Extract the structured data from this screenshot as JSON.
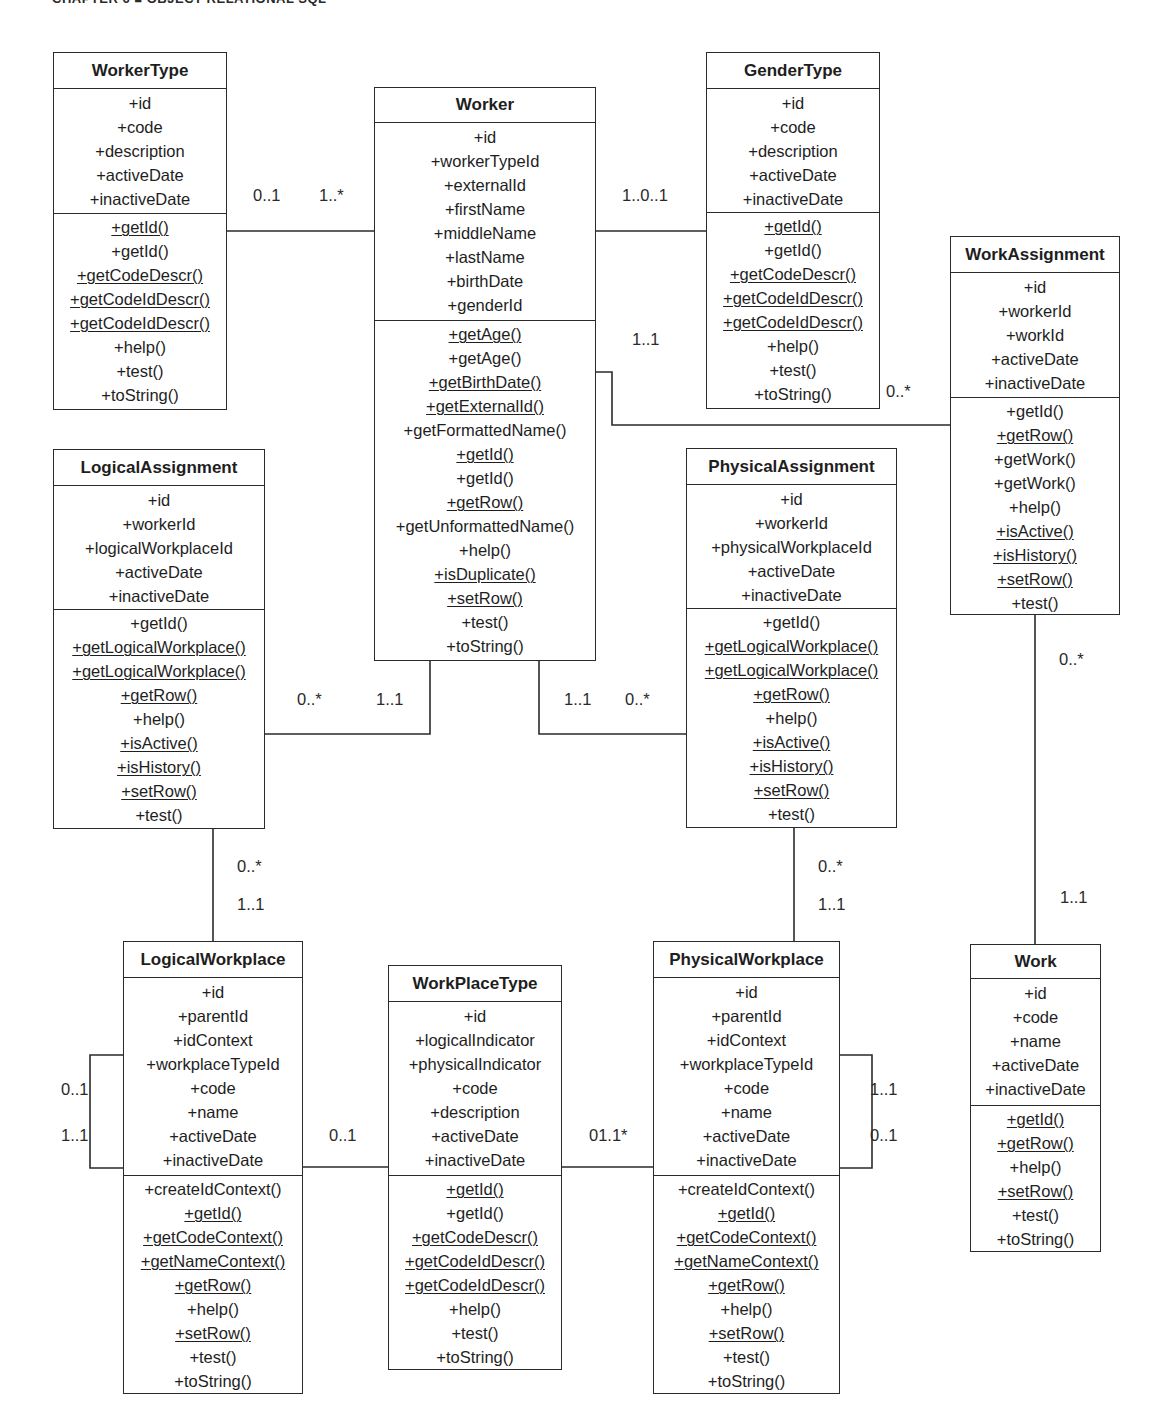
{
  "page": {
    "header": "CHAPTER 6 ■ OBJECT-RELATIONAL SQL"
  },
  "classes": {
    "workerType": {
      "name": "WorkerType",
      "attributes": [
        "+id",
        "+code",
        "+description",
        "+activeDate",
        "+inactiveDate"
      ],
      "methods": [
        {
          "label": "+getId()",
          "static": true
        },
        {
          "label": "+getId()",
          "static": false
        },
        {
          "label": "+getCodeDescr()",
          "static": true
        },
        {
          "label": "+getCodeIdDescr()",
          "static": true
        },
        {
          "label": "+getCodeIdDescr()",
          "static": true
        },
        {
          "label": "+help()",
          "static": false
        },
        {
          "label": "+test()",
          "static": false
        },
        {
          "label": "+toString()",
          "static": false
        }
      ]
    },
    "worker": {
      "name": "Worker",
      "attributes": [
        "+id",
        "+workerTypeId",
        "+externalId",
        "+firstName",
        "+middleName",
        "+lastName",
        "+birthDate",
        "+genderId"
      ],
      "methods": [
        {
          "label": "+getAge()",
          "static": true
        },
        {
          "label": "+getAge()",
          "static": false
        },
        {
          "label": "+getBirthDate()",
          "static": true
        },
        {
          "label": "+getExternalId()",
          "static": true
        },
        {
          "label": "+getFormattedName()",
          "static": false
        },
        {
          "label": "+getId()",
          "static": true
        },
        {
          "label": "+getId()",
          "static": false
        },
        {
          "label": "+getRow()",
          "static": true
        },
        {
          "label": "+getUnformattedName()",
          "static": false
        },
        {
          "label": "+help()",
          "static": false
        },
        {
          "label": "+isDuplicate()",
          "static": true
        },
        {
          "label": "+setRow()",
          "static": true
        },
        {
          "label": "+test()",
          "static": false
        },
        {
          "label": "+toString()",
          "static": false
        }
      ]
    },
    "genderType": {
      "name": "GenderType",
      "attributes": [
        "+id",
        "+code",
        "+description",
        "+activeDate",
        "+inactiveDate"
      ],
      "methods": [
        {
          "label": "+getId()",
          "static": true
        },
        {
          "label": "+getId()",
          "static": false
        },
        {
          "label": "+getCodeDescr()",
          "static": true
        },
        {
          "label": "+getCodeIdDescr()",
          "static": true
        },
        {
          "label": "+getCodeIdDescr()",
          "static": true
        },
        {
          "label": "+help()",
          "static": false
        },
        {
          "label": "+test()",
          "static": false
        },
        {
          "label": "+toString()",
          "static": false
        }
      ]
    },
    "workAssignment": {
      "name": "WorkAssignment",
      "attributes": [
        "+id",
        "+workerId",
        "+workId",
        "+activeDate",
        "+inactiveDate"
      ],
      "methods": [
        {
          "label": "+getId()",
          "static": false
        },
        {
          "label": "+getRow()",
          "static": true
        },
        {
          "label": "+getWork()",
          "static": false
        },
        {
          "label": "+getWork()",
          "static": false
        },
        {
          "label": "+help()",
          "static": false
        },
        {
          "label": "+isActive()",
          "static": true
        },
        {
          "label": "+isHistory()",
          "static": true
        },
        {
          "label": "+setRow()",
          "static": true
        },
        {
          "label": "+test()",
          "static": false
        }
      ]
    },
    "logicalAssignment": {
      "name": "LogicalAssignment",
      "attributes": [
        "+id",
        "+workerId",
        "+logicalWorkplaceId",
        "+activeDate",
        "+inactiveDate"
      ],
      "methods": [
        {
          "label": "+getId()",
          "static": false
        },
        {
          "label": "+getLogicalWorkplace()",
          "static": true
        },
        {
          "label": "+getLogicalWorkplace()",
          "static": true
        },
        {
          "label": "+getRow()",
          "static": true
        },
        {
          "label": "+help()",
          "static": false
        },
        {
          "label": "+isActive()",
          "static": true
        },
        {
          "label": "+isHistory()",
          "static": true
        },
        {
          "label": "+setRow()",
          "static": true
        },
        {
          "label": "+test()",
          "static": false
        }
      ]
    },
    "physicalAssignment": {
      "name": "PhysicalAssignment",
      "attributes": [
        "+id",
        "+workerId",
        "+physicalWorkplaceId",
        "+activeDate",
        "+inactiveDate"
      ],
      "methods": [
        {
          "label": "+getId()",
          "static": false
        },
        {
          "label": "+getLogicalWorkplace()",
          "static": true
        },
        {
          "label": "+getLogicalWorkplace()",
          "static": true
        },
        {
          "label": "+getRow()",
          "static": true
        },
        {
          "label": "+help()",
          "static": false
        },
        {
          "label": "+isActive()",
          "static": true
        },
        {
          "label": "+isHistory()",
          "static": true
        },
        {
          "label": "+setRow()",
          "static": true
        },
        {
          "label": "+test()",
          "static": false
        }
      ]
    },
    "logicalWorkplace": {
      "name": "LogicalWorkplace",
      "attributes": [
        "+id",
        "+parentId",
        "+idContext",
        "+workplaceTypeId",
        "+code",
        "+name",
        "+activeDate",
        "+inactiveDate"
      ],
      "methods": [
        {
          "label": "+createIdContext()",
          "static": false
        },
        {
          "label": "+getId()",
          "static": true
        },
        {
          "label": "+getCodeContext()",
          "static": true
        },
        {
          "label": "+getNameContext()",
          "static": true
        },
        {
          "label": "+getRow()",
          "static": true
        },
        {
          "label": "+help()",
          "static": false
        },
        {
          "label": "+setRow()",
          "static": true
        },
        {
          "label": "+test()",
          "static": false
        },
        {
          "label": "+toString()",
          "static": false
        }
      ]
    },
    "workPlaceType": {
      "name": "WorkPlaceType",
      "attributes": [
        "+id",
        "+logicalIndicator",
        "+physicalIndicator",
        "+code",
        "+description",
        "+activeDate",
        "+inactiveDate"
      ],
      "methods": [
        {
          "label": "+getId()",
          "static": true
        },
        {
          "label": "+getId()",
          "static": false
        },
        {
          "label": "+getCodeDescr()",
          "static": true
        },
        {
          "label": "+getCodeIdDescr()",
          "static": true
        },
        {
          "label": "+getCodeIdDescr()",
          "static": true
        },
        {
          "label": "+help()",
          "static": false
        },
        {
          "label": "+test()",
          "static": false
        },
        {
          "label": "+toString()",
          "static": false
        }
      ]
    },
    "physicalWorkplace": {
      "name": "PhysicalWorkplace",
      "attributes": [
        "+id",
        "+parentId",
        "+idContext",
        "+workplaceTypeId",
        "+code",
        "+name",
        "+activeDate",
        "+inactiveDate"
      ],
      "methods": [
        {
          "label": "+createIdContext()",
          "static": false
        },
        {
          "label": "+getId()",
          "static": true
        },
        {
          "label": "+getCodeContext()",
          "static": true
        },
        {
          "label": "+getNameContext()",
          "static": true
        },
        {
          "label": "+getRow()",
          "static": true
        },
        {
          "label": "+help()",
          "static": false
        },
        {
          "label": "+setRow()",
          "static": true
        },
        {
          "label": "+test()",
          "static": false
        },
        {
          "label": "+toString()",
          "static": false
        }
      ]
    },
    "work": {
      "name": "Work",
      "attributes": [
        "+id",
        "+code",
        "+name",
        "+activeDate",
        "+inactiveDate"
      ],
      "methods": [
        {
          "label": "+getId()",
          "static": true
        },
        {
          "label": "+getRow()",
          "static": true
        },
        {
          "label": "+help()",
          "static": false
        },
        {
          "label": "+setRow()",
          "static": true
        },
        {
          "label": "+test()",
          "static": false
        },
        {
          "label": "+toString()",
          "static": false
        }
      ]
    }
  },
  "associations": {
    "workerType_worker": {
      "from": "WorkerType",
      "to": "Worker",
      "from_mult": "0..1",
      "to_mult": "1..*"
    },
    "worker_genderType": {
      "from": "Worker",
      "to": "GenderType",
      "label": "1..0..1"
    },
    "worker_workAssignment": {
      "from": "Worker",
      "to": "WorkAssignment",
      "from_mult": "1..1",
      "to_mult": "0..*"
    },
    "logicalAssignment_worker": {
      "from": "LogicalAssignment",
      "to": "Worker",
      "from_mult": "0..*",
      "to_mult": "1..1"
    },
    "worker_physicalAssignment": {
      "from": "Worker",
      "to": "PhysicalAssignment",
      "from_mult": "1..1",
      "to_mult": "0..*"
    },
    "workAssignment_work": {
      "from": "WorkAssignment",
      "to": "Work",
      "from_mult": "0..*",
      "to_mult": "1..1"
    },
    "logicalAssignment_logicalWorkplace": {
      "from": "LogicalAssignment",
      "to": "LogicalWorkplace",
      "from_mult": "0..*",
      "to_mult": "1..1"
    },
    "physicalAssignment_physicalWorkplace": {
      "from": "PhysicalAssignment",
      "to": "PhysicalWorkplace",
      "from_mult": "0..*",
      "to_mult": "1..1"
    },
    "logicalWorkplace_self": {
      "from": "LogicalWorkplace",
      "to": "LogicalWorkplace",
      "from_mult": "0..1",
      "to_mult": "1..1"
    },
    "physicalWorkplace_self": {
      "from": "PhysicalWorkplace",
      "to": "PhysicalWorkplace",
      "from_mult": "1..1",
      "to_mult": "0..1"
    },
    "logicalWorkplace_workPlaceType": {
      "from": "LogicalWorkplace",
      "to": "WorkPlaceType",
      "label": "0..1"
    },
    "workPlaceType_physicalWorkplace": {
      "from": "WorkPlaceType",
      "to": "PhysicalWorkplace",
      "label": "01.1*"
    }
  },
  "colors": {
    "line": "#2a2a2a",
    "background": "#ffffff",
    "text": "#1e1e1e"
  }
}
